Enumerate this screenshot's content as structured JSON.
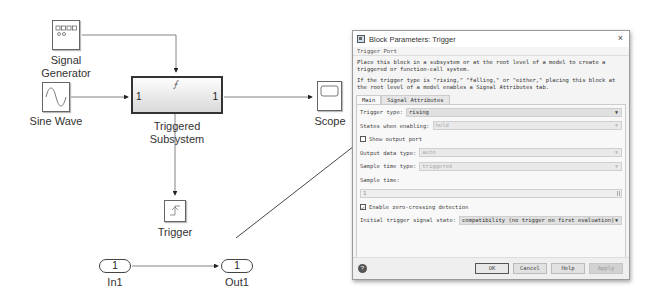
{
  "model": {
    "blocks": {
      "signal_generator": {
        "label_line1": "Signal",
        "label_line2": "Generator",
        "icon": "signal-generator-icon"
      },
      "sine_wave": {
        "label": "Sine Wave",
        "icon": "sine-wave-icon"
      },
      "triggered_subsystem": {
        "label_line1": "Triggered",
        "label_line2": "Subsystem",
        "in_port": "1",
        "out_port": "1",
        "trigger_glyph": "⨍"
      },
      "scope": {
        "label": "Scope",
        "icon": "scope-icon"
      },
      "trigger": {
        "label": "Trigger",
        "icon": "rising-edge-icon"
      },
      "in1": {
        "label": "In1",
        "port_number": "1"
      },
      "out1": {
        "label": "Out1",
        "port_number": "1"
      }
    }
  },
  "dialog": {
    "title": "Block Parameters: Trigger",
    "close_glyph": "×",
    "section": "Trigger Port",
    "description": [
      "Place this block in a subsystem or at the root level of a model to create a triggered or function-call system.",
      "If the trigger type is \"rising,\" \"falling,\" or \"either,\" placing this block at the root level of a model enables a Signal Attributes tab."
    ],
    "tabs": [
      {
        "label": "Main",
        "active": true
      },
      {
        "label": "Signal Attributes",
        "active": false
      }
    ],
    "fields": {
      "trigger_type": {
        "label": "Trigger type:",
        "value": "rising",
        "enabled": true
      },
      "states_when_enabling": {
        "label": "States when enabling:",
        "value": "held",
        "enabled": false
      },
      "show_output_port": {
        "label": "Show output port",
        "checked": false
      },
      "output_data_type": {
        "label": "Output data type:",
        "value": "auto",
        "enabled": false
      },
      "sample_time_type": {
        "label": "Sample time type:",
        "value": "triggered",
        "enabled": false
      },
      "sample_time": {
        "label": "Sample time:",
        "value": "1",
        "enabled": false
      },
      "enable_zero_crossing": {
        "label": "Enable zero-crossing detection",
        "checked": true,
        "check_glyph": "✓"
      },
      "initial_trigger_signal_state": {
        "label": "Initial trigger signal state:",
        "value": "compatibility (no trigger on first evaluation)",
        "enabled": true
      }
    },
    "dropdown_arrow": "▼",
    "buttons": {
      "help_icon_glyph": "?",
      "ok": "OK",
      "cancel": "Cancel",
      "help": "Help",
      "apply": "Apply"
    }
  }
}
